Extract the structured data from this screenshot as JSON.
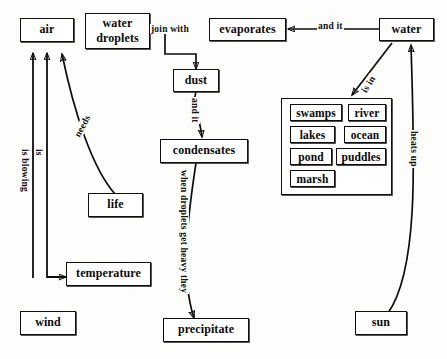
{
  "diagram": {
    "nodes": {
      "air": "air",
      "water_droplets": "water droplets",
      "evaporates": "evaporates",
      "water": "water",
      "dust": "dust",
      "condensates": "condensates",
      "life": "life",
      "temperature": "temperature",
      "wind": "wind",
      "precipitate": "precipitate",
      "sun": "sun"
    },
    "water_bodies": [
      "swamps",
      "river",
      "lakes",
      "ocean",
      "pond",
      "puddles",
      "marsh"
    ],
    "edge_labels": {
      "join_with": "join with",
      "and_it_top": "and it",
      "and_it_dust": "and it",
      "is_in": "is in",
      "heats_up": "heats up",
      "needs": "needs",
      "is_blowing": "is blowing",
      "is": "is",
      "when_heavy": "when droplets get heavy they"
    }
  },
  "colors": {
    "ink": "#0d0d0d",
    "paper": "#fdfdfc"
  }
}
